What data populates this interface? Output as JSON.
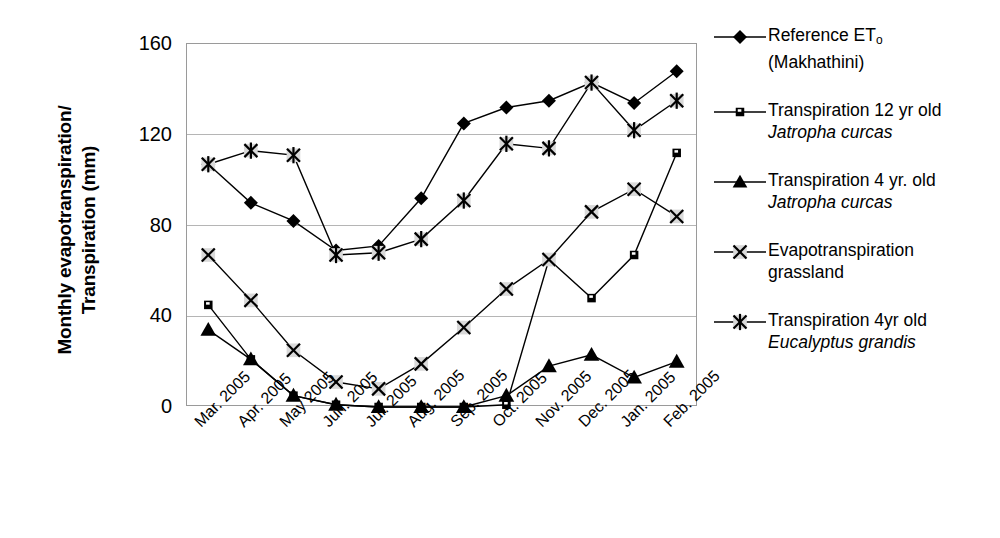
{
  "axis": {
    "y_title_line1": "Monthly evapotranspiration/",
    "y_title_line2": "Transpiration (mm)",
    "y_ticks": [
      "0",
      "40",
      "80",
      "120",
      "160"
    ],
    "x_ticks": [
      "Mar. 2005",
      "Apr. 2005",
      "May 2005",
      "Jun. 2005",
      "Jul. 2005",
      "Aug. 2005",
      "Sep. 2005",
      "Oct. 2005",
      "Nov. 2005",
      "Dec. 2005",
      "Jan. 2005",
      "Feb. 2005"
    ]
  },
  "legend": {
    "items": [
      {
        "marker": "diamond-marker",
        "name": "legend-reference-et",
        "line1": "Reference ET",
        "sub": "o",
        "line2": "(Makhathini)",
        "italic2": false
      },
      {
        "marker": "square-marker",
        "name": "legend-transpiration-12yr-jatropha",
        "line1": "Transpiration 12 yr old",
        "sub": "",
        "line2": "Jatropha curcas",
        "italic2": true
      },
      {
        "marker": "triangle-marker",
        "name": "legend-transpiration-4yr-jatropha",
        "line1": "Transpiration 4 yr. old",
        "sub": "",
        "line2": "Jatropha curcas",
        "italic2": true
      },
      {
        "marker": "cross-marker",
        "name": "legend-evapotranspiration-grassland",
        "line1": "Evapotranspiration",
        "sub": "",
        "line2": "grassland",
        "italic2": false
      },
      {
        "marker": "asterisk-marker",
        "name": "legend-transpiration-4yr-eucalyptus",
        "line1": "Transpiration 4yr old",
        "sub": "",
        "line2": "Eucalyptus grandis",
        "italic2": true
      }
    ]
  },
  "chart_data": {
    "type": "line",
    "title": "",
    "xlabel": "",
    "ylabel": "Monthly evapotranspiration/Transpiration (mm)",
    "ylim": [
      0,
      160
    ],
    "yticks": [
      0,
      40,
      80,
      120,
      160
    ],
    "grid": true,
    "legend_position": "right",
    "categories": [
      "Mar. 2005",
      "Apr. 2005",
      "May 2005",
      "Jun. 2005",
      "Jul. 2005",
      "Aug. 2005",
      "Sep. 2005",
      "Oct. 2005",
      "Nov. 2005",
      "Dec. 2005",
      "Jan. 2005",
      "Feb. 2005"
    ],
    "series": [
      {
        "name": "Reference ETo (Makhathini)",
        "marker": "diamond",
        "values": [
          107,
          90,
          82,
          69,
          71,
          92,
          125,
          132,
          135,
          143,
          134,
          148
        ]
      },
      {
        "name": "Transpiration 12 yr old Jatropha curcas",
        "marker": "square",
        "values": [
          45,
          21,
          5,
          1,
          0,
          0,
          0,
          1,
          65,
          48,
          67,
          112
        ]
      },
      {
        "name": "Transpiration 4 yr. old Jatropha curcas",
        "marker": "triangle",
        "values": [
          34,
          21,
          5,
          1,
          0,
          0,
          0,
          5,
          18,
          23,
          13,
          20
        ]
      },
      {
        "name": "Evapotranspiration grassland",
        "marker": "cross",
        "values": [
          67,
          47,
          25,
          11,
          8,
          19,
          35,
          52,
          65,
          86,
          96,
          84
        ]
      },
      {
        "name": "Transpiration 4yr old Eucalyptus grandis",
        "marker": "asterisk",
        "values": [
          107,
          113,
          111,
          67,
          68,
          74,
          91,
          116,
          114,
          143,
          122,
          135
        ]
      }
    ]
  }
}
